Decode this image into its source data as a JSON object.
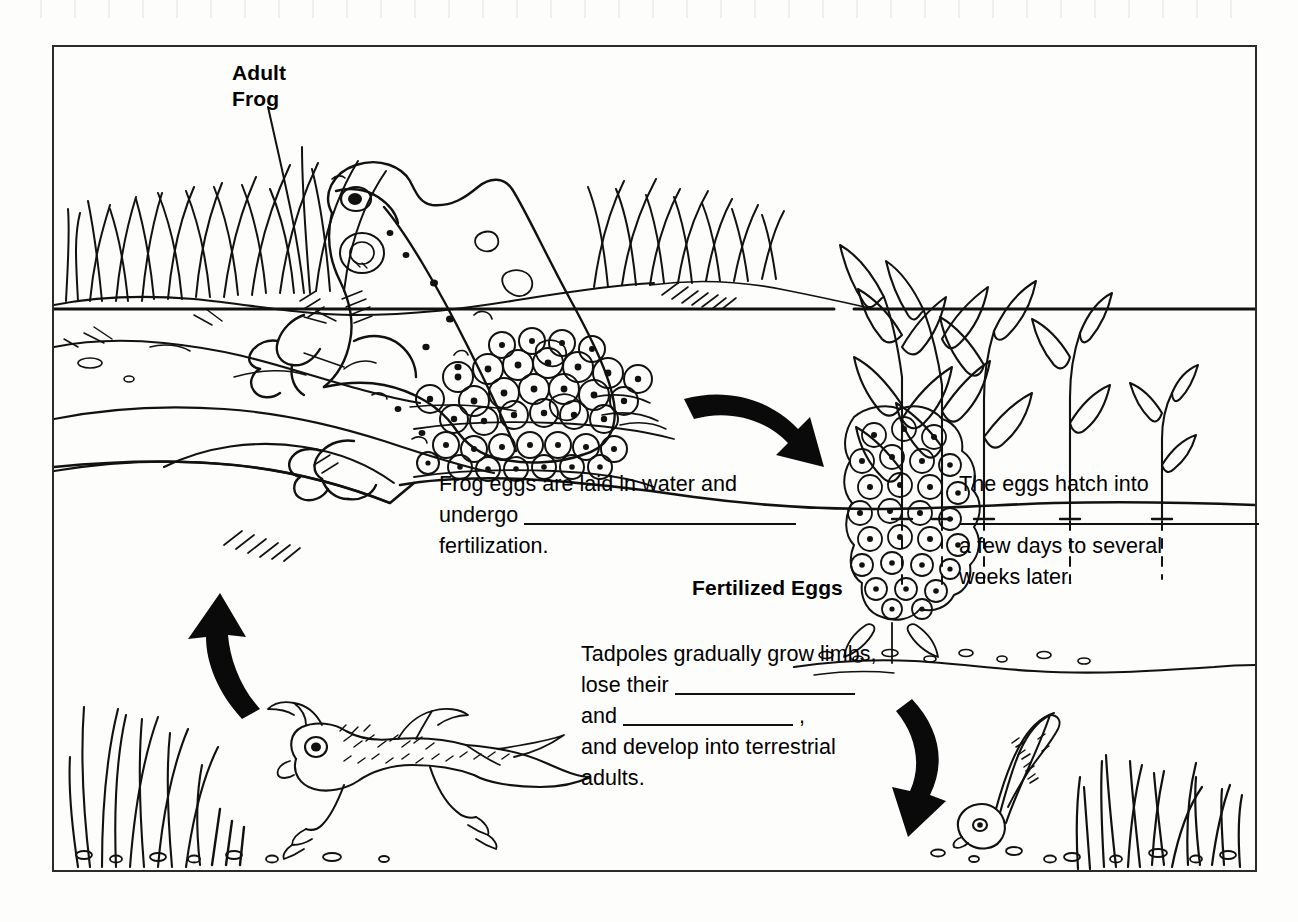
{
  "document": {
    "kind": "worksheet-figure",
    "title": "Frog Life Cycle",
    "background_color": "#fdfdfc",
    "ink_color": "#000000",
    "frame_border_color": "#2b2b2b"
  },
  "figure": {
    "labels": {
      "adult_frog": "Adult\nFrog",
      "fertilized_eggs": "Fertilized Eggs"
    },
    "captions": [
      {
        "id": "caption-eggs-laid",
        "lines": [
          {
            "segments": [
              {
                "type": "text",
                "value": "Frog eggs are laid in water and"
              }
            ]
          },
          {
            "segments": [
              {
                "type": "text",
                "value": "undergo "
              },
              {
                "type": "blank",
                "size": "long"
              }
            ]
          },
          {
            "segments": [
              {
                "type": "text",
                "value": "fertilization."
              }
            ]
          }
        ]
      },
      {
        "id": "caption-eggs-hatch",
        "lines": [
          {
            "segments": [
              {
                "type": "text",
                "value": "The eggs hatch into"
              }
            ]
          },
          {
            "segments": [
              {
                "type": "blank",
                "size": "mid"
              }
            ]
          },
          {
            "segments": [
              {
                "type": "text",
                "value": "a few days to several"
              }
            ]
          },
          {
            "segments": [
              {
                "type": "text",
                "value": "weeks later."
              }
            ]
          }
        ]
      },
      {
        "id": "caption-tadpoles-grow",
        "lines": [
          {
            "segments": [
              {
                "type": "text",
                "value": "Tadpoles gradually grow limbs,"
              }
            ]
          },
          {
            "segments": [
              {
                "type": "text",
                "value": "lose their "
              },
              {
                "type": "blank",
                "size": "med"
              }
            ]
          },
          {
            "segments": [
              {
                "type": "text",
                "value": "and "
              },
              {
                "type": "blank",
                "size": "short"
              },
              {
                "type": "text",
                "value": " ,"
              }
            ]
          },
          {
            "segments": [
              {
                "type": "text",
                "value": "and develop into terrestrial"
              }
            ]
          },
          {
            "segments": [
              {
                "type": "text",
                "value": "adults."
              }
            ]
          }
        ]
      }
    ],
    "illustrations": [
      {
        "name": "adult-frog-illustration",
        "description": "Adult frog sitting on pond bank"
      },
      {
        "name": "bank-grass-illustration",
        "description": "Tall grass and reeds along the shoreline"
      },
      {
        "name": "egg-mass-illustration",
        "description": "Floating cluster of frog eggs at the water surface"
      },
      {
        "name": "aquatic-plants-illustration",
        "description": "Emergent water plants with leaves and dashed stems"
      },
      {
        "name": "fertilized-egg-cluster-illustration",
        "description": "Vertical cluster of fertilized eggs attached to plants"
      },
      {
        "name": "tadpole-illustration",
        "description": "Young tadpole with tail and no limbs"
      },
      {
        "name": "froglet-illustration",
        "description": "Tadpole with developed front and hind limbs"
      },
      {
        "name": "underwater-grass-illustration",
        "description": "Submerged grass blades on the pond floor"
      },
      {
        "name": "pebbles-illustration",
        "description": "Small pebbles scattered on the pond bottom"
      },
      {
        "name": "waterline",
        "description": "Horizontal water surface line"
      },
      {
        "name": "pond-floor-line",
        "description": "Wavy sediment line along the pond bottom"
      }
    ],
    "arrows": [
      {
        "name": "arrow-eggs-to-fertilized-eggs",
        "direction": "right-down",
        "from": "egg-mass",
        "to": "fertilized-eggs"
      },
      {
        "name": "arrow-fertilized-eggs-to-tadpole",
        "direction": "down-left",
        "from": "fertilized-eggs",
        "to": "tadpole"
      },
      {
        "name": "arrow-froglet-to-adult-frog",
        "direction": "up-left",
        "from": "froglet",
        "to": "adult-frog"
      }
    ]
  }
}
